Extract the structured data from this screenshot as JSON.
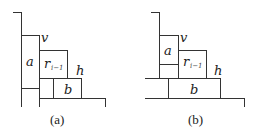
{
  "figure": {
    "panels": [
      {
        "caption": "(a)",
        "labels": {
          "a": "a",
          "v": "v",
          "r": "r",
          "r_sub": "i−1",
          "h": "h",
          "b": "b"
        }
      },
      {
        "caption": "(b)",
        "labels": {
          "a": "a",
          "v": "v",
          "r": "r",
          "r_sub": "i−1",
          "h": "h",
          "b": "b"
        }
      }
    ],
    "colors": {
      "line": "#333333",
      "text": "#222222"
    }
  }
}
